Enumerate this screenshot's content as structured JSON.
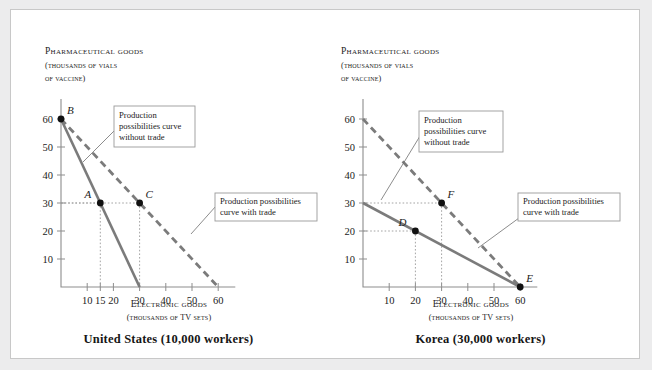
{
  "figure": {
    "background_color": "#ffffff",
    "page_color": "#ececed",
    "curve_color": "#7b7b7b",
    "axis_color": "#8d8d8d"
  },
  "common": {
    "y_axis_title": "Pharmaceutical goods",
    "y_axis_sub_line1": "(thousands of vials",
    "y_axis_sub_line2": "of vaccine)",
    "x_axis_title": "Electronic goods",
    "x_axis_sub": "(thousands of TV sets)",
    "callout_without_trade_line1": "Production",
    "callout_without_trade_line2": "possibilities curve",
    "callout_without_trade_line3": "without trade",
    "callout_with_trade_line1": "Production possibilities",
    "callout_with_trade_line2": "curve with trade"
  },
  "chart_data": [
    {
      "type": "line",
      "title": "United States (10,000 workers)",
      "xlabel": "Electronic goods (thousands of TV sets)",
      "ylabel": "Pharmaceutical goods (thousands of vials of vaccine)",
      "xlim": [
        0,
        65
      ],
      "ylim": [
        0,
        65
      ],
      "xticks": [
        10,
        15,
        20,
        30,
        40,
        50,
        60
      ],
      "yticks": [
        10,
        20,
        30,
        40,
        50,
        60
      ],
      "grid": false,
      "series": [
        {
          "name": "Production possibilities curve without trade",
          "style": "solid",
          "points": [
            [
              0,
              60
            ],
            [
              30,
              0
            ]
          ]
        },
        {
          "name": "Production possibilities curve with trade",
          "style": "dashed",
          "points": [
            [
              0,
              60
            ],
            [
              60,
              0
            ]
          ]
        }
      ],
      "annotated_points": [
        {
          "label": "B",
          "x": 0,
          "y": 60,
          "label_pos": "upper-right"
        },
        {
          "label": "A",
          "x": 15,
          "y": 30,
          "label_pos": "upper-left"
        },
        {
          "label": "C",
          "x": 30,
          "y": 30,
          "label_pos": "upper-right"
        }
      ]
    },
    {
      "type": "line",
      "title": "Korea (30,000 workers)",
      "xlabel": "Electronic goods (thousands of TV sets)",
      "ylabel": "Pharmaceutical goods (thousands of vials of vaccine)",
      "xlim": [
        0,
        65
      ],
      "ylim": [
        0,
        65
      ],
      "xticks": [
        10,
        20,
        30,
        40,
        50,
        60
      ],
      "yticks": [
        10,
        20,
        30,
        40,
        50,
        60
      ],
      "grid": false,
      "series": [
        {
          "name": "Production possibilities curve without trade",
          "style": "solid",
          "points": [
            [
              0,
              30
            ],
            [
              60,
              0
            ]
          ]
        },
        {
          "name": "Production possibilities curve with trade",
          "style": "dashed",
          "points": [
            [
              0,
              60
            ],
            [
              60,
              0
            ]
          ]
        }
      ],
      "annotated_points": [
        {
          "label": "F",
          "x": 30,
          "y": 30,
          "label_pos": "upper-right"
        },
        {
          "label": "D",
          "x": 20,
          "y": 20,
          "label_pos": "upper-left"
        },
        {
          "label": "E",
          "x": 60,
          "y": 0,
          "label_pos": "upper-right"
        }
      ]
    }
  ]
}
